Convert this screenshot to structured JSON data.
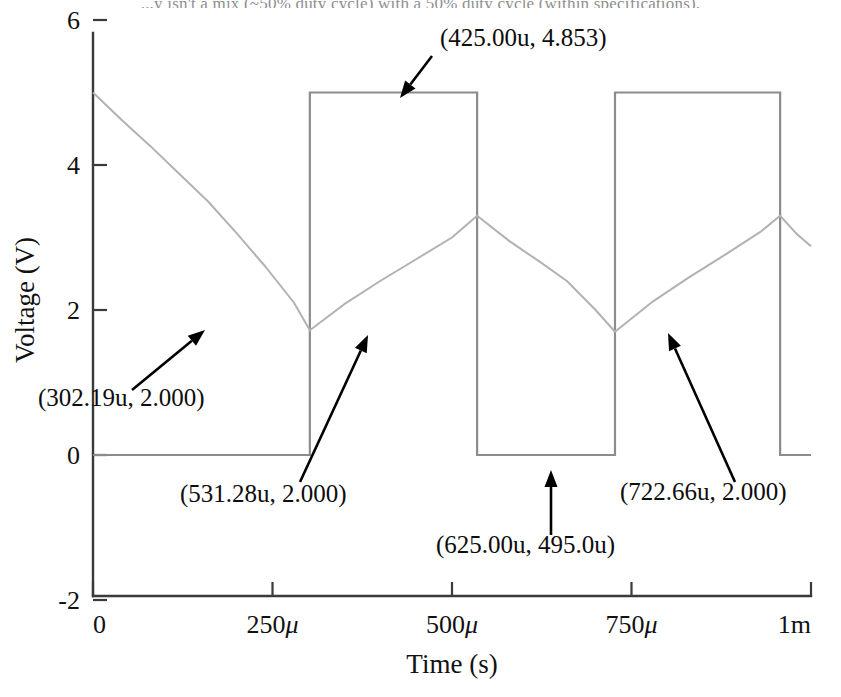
{
  "page": {
    "top_text": "...y isn't a mix (~50% duty cycle) with a 50% duty cycle (within specifications)."
  },
  "chart_data": {
    "type": "line",
    "title": "",
    "xlabel": "Time (s)",
    "ylabel": "Voltage (V)",
    "xlim": [
      0,
      0.001
    ],
    "ylim": [
      -2,
      6
    ],
    "grid": false,
    "legend": null,
    "xticks": [
      {
        "value": 0,
        "label": "0"
      },
      {
        "value": 0.00025,
        "label": "250",
        "suffix": "μ"
      },
      {
        "value": 0.0005,
        "label": "500",
        "suffix": "μ"
      },
      {
        "value": 0.00075,
        "label": "750",
        "suffix": "μ"
      },
      {
        "value": 0.001,
        "label": "1m",
        "suffix": ""
      }
    ],
    "yticks": [
      {
        "value": 6,
        "label": "6"
      },
      {
        "value": 4,
        "label": "4"
      },
      {
        "value": 2,
        "label": "2"
      },
      {
        "value": 0,
        "label": "0"
      },
      {
        "value": -2,
        "label": "-2"
      }
    ],
    "series": [
      {
        "name": "square-output",
        "color": "#8c8c8c",
        "points": [
          [
            0.0,
            0.0
          ],
          [
            0.000302,
            0.0
          ],
          [
            0.000302,
            5.0
          ],
          [
            0.000535,
            5.0
          ],
          [
            0.000535,
            0.0
          ],
          [
            0.000727,
            0.0
          ],
          [
            0.000727,
            5.0
          ],
          [
            0.000957,
            5.0
          ],
          [
            0.000957,
            0.0
          ],
          [
            0.001,
            0.0
          ]
        ]
      },
      {
        "name": "capacitor-ramp",
        "color": "#b2b2b2",
        "points": [
          [
            0.0,
            5.0
          ],
          [
            4e-05,
            4.62
          ],
          [
            8e-05,
            4.26
          ],
          [
            0.00012,
            3.88
          ],
          [
            0.00016,
            3.5
          ],
          [
            0.0002,
            3.06
          ],
          [
            0.00024,
            2.6
          ],
          [
            0.00028,
            2.1
          ],
          [
            0.000302,
            1.72
          ],
          [
            0.00035,
            2.08
          ],
          [
            0.0004,
            2.4
          ],
          [
            0.00045,
            2.7
          ],
          [
            0.0005,
            3.0
          ],
          [
            0.000535,
            3.3
          ],
          [
            0.00058,
            2.95
          ],
          [
            0.00062,
            2.68
          ],
          [
            0.00066,
            2.4
          ],
          [
            0.0007,
            2.0
          ],
          [
            0.000727,
            1.7
          ],
          [
            0.00078,
            2.12
          ],
          [
            0.00083,
            2.45
          ],
          [
            0.00088,
            2.76
          ],
          [
            0.00093,
            3.08
          ],
          [
            0.000957,
            3.3
          ],
          [
            0.00098,
            3.05
          ],
          [
            0.001,
            2.88
          ]
        ]
      }
    ],
    "annotations": [
      {
        "name": "annotation-425u",
        "text": "(425.00u, 4.853)",
        "label_x": 440,
        "label_y": 46,
        "leader": {
          "x1": 432,
          "y1": 56,
          "x2": 400,
          "y2": 98
        },
        "arrow": "down-left"
      },
      {
        "name": "annotation-302u",
        "text": "(302.19u, 2.000)",
        "label_x": 38,
        "label_y": 406,
        "leader": {
          "x1": 132,
          "y1": 390,
          "x2": 205,
          "y2": 330
        },
        "arrow": "up-right"
      },
      {
        "name": "annotation-531u",
        "text": "(531.28u, 2.000)",
        "label_x": 180,
        "label_y": 502,
        "leader": {
          "x1": 300,
          "y1": 482,
          "x2": 368,
          "y2": 335
        },
        "arrow": "up-right"
      },
      {
        "name": "annotation-625u",
        "text": "(625.00u, 495.0u)",
        "label_x": 436,
        "label_y": 553,
        "leader": {
          "x1": 551,
          "y1": 535,
          "x2": 551,
          "y2": 470
        },
        "arrow": "up"
      },
      {
        "name": "annotation-722u",
        "text": "(722.66u, 2.000)",
        "label_x": 620,
        "label_y": 500,
        "leader": {
          "x1": 735,
          "y1": 482,
          "x2": 668,
          "y2": 333
        },
        "arrow": "up-left"
      }
    ]
  }
}
